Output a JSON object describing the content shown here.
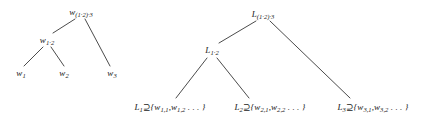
{
  "figure": {
    "background_color": "#ffffff",
    "ink_color": "#1a1a1a"
  },
  "left_tree": {
    "name": "word-tree",
    "root": {
      "id": "w-root",
      "text": "w",
      "sub_html": "(1·2)·3",
      "x": 81,
      "y": 12
    },
    "internal": {
      "id": "w-12",
      "text": "w",
      "sub_html": "1·2",
      "x": 47,
      "y": 40
    },
    "leaves": [
      {
        "id": "w-1",
        "text": "w",
        "sub_html": "1",
        "x": 21,
        "y": 73
      },
      {
        "id": "w-2",
        "text": "w",
        "sub_html": "2",
        "x": 64,
        "y": 73
      },
      {
        "id": "w-3",
        "text": "w",
        "sub_html": "3",
        "x": 112,
        "y": 73
      }
    ],
    "edges": [
      {
        "from": "w-root",
        "to": "w-12",
        "x1": 75,
        "y1": 19,
        "x2": 53,
        "y2": 33
      },
      {
        "from": "w-root",
        "to": "w-3",
        "x1": 85,
        "y1": 19,
        "x2": 110,
        "y2": 66
      },
      {
        "from": "w-12",
        "to": "w-1",
        "x1": 43,
        "y1": 47,
        "x2": 24,
        "y2": 66
      },
      {
        "from": "w-12",
        "to": "w-2",
        "x1": 51,
        "y1": 47,
        "x2": 64,
        "y2": 66
      }
    ]
  },
  "right_tree": {
    "name": "language-tree",
    "root": {
      "id": "L-root",
      "text": "L",
      "sub_html": "(1·2)·3",
      "x": 263,
      "y": 14
    },
    "internal": {
      "id": "L-12",
      "text": "L",
      "sub_html": "1·2",
      "x": 212,
      "y": 50
    },
    "leaves": [
      {
        "id": "L-1",
        "label_text": "L",
        "label_sub": "1",
        "relation": "⊇",
        "set_text": "{w",
        "set_sub_1": "1,1",
        "set_mid": ",w",
        "set_sub_2": "1,2",
        "set_tail": " . . . }",
        "x": 170,
        "y": 107
      },
      {
        "id": "L-2",
        "label_text": "L",
        "label_sub": "2",
        "relation": "⊇",
        "set_text": "{w",
        "set_sub_1": "2,1",
        "set_mid": ",w",
        "set_sub_2": "2,2",
        "set_tail": " . . . }",
        "x": 270,
        "y": 107
      },
      {
        "id": "L-3",
        "label_text": "L",
        "label_sub": "3",
        "relation": "⊇",
        "set_text": "{w",
        "set_sub_1": "3,1",
        "set_mid": ",w",
        "set_sub_2": "3,2",
        "set_tail": " . . . }",
        "x": 373,
        "y": 107
      }
    ],
    "edges": [
      {
        "from": "L-root",
        "to": "L-12",
        "x1": 256,
        "y1": 21,
        "x2": 219,
        "y2": 43
      },
      {
        "from": "L-root",
        "to": "L-3",
        "x1": 270,
        "y1": 21,
        "x2": 350,
        "y2": 98
      },
      {
        "from": "L-12",
        "to": "L-1",
        "x1": 207,
        "y1": 58,
        "x2": 176,
        "y2": 98
      },
      {
        "from": "L-12",
        "to": "L-2",
        "x1": 217,
        "y1": 58,
        "x2": 249,
        "y2": 98
      }
    ]
  }
}
